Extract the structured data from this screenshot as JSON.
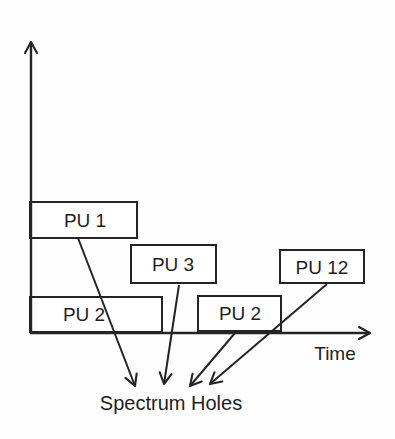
{
  "diagram": {
    "boxes": [
      {
        "label": "PU 1"
      },
      {
        "label": "PU 3"
      },
      {
        "label": "PU 12"
      },
      {
        "label": "PU 2"
      },
      {
        "label": "PU 2"
      }
    ],
    "x_axis_label": "Time",
    "annotation": "Spectrum Holes",
    "colors": {
      "stroke": "#242424",
      "text": "#1e1e1e",
      "box_fill": "#ffffff",
      "background": "#fefefe"
    }
  }
}
